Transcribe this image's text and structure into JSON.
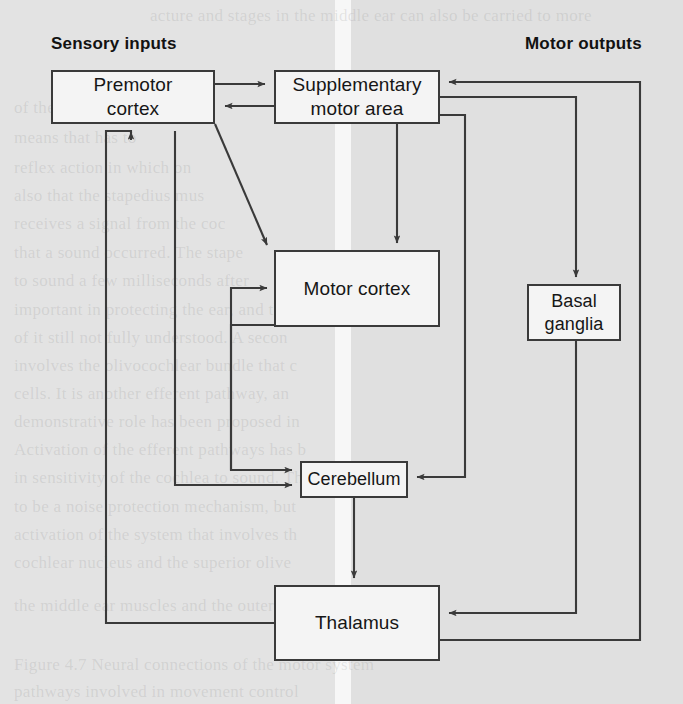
{
  "figure": {
    "labels": {
      "sensory_inputs": "Sensory inputs",
      "motor_outputs": "Motor outputs"
    },
    "nodes": [
      {
        "id": "premotor_cortex",
        "label": "Premotor\ncortex",
        "line1": "Premotor",
        "line2": "cortex",
        "x": 51,
        "y": 70,
        "w": 164,
        "h": 54
      },
      {
        "id": "supplementary_motor_area",
        "label": "Supplementary\nmotor area",
        "line1": "Supplementary",
        "line2": "motor area",
        "x": 274,
        "y": 70,
        "w": 166,
        "h": 54
      },
      {
        "id": "motor_cortex",
        "label": "Motor cortex",
        "line1": "Motor cortex",
        "line2": "",
        "x": 274,
        "y": 250,
        "w": 166,
        "h": 77
      },
      {
        "id": "basal_ganglia",
        "label": "Basal\nganglia",
        "line1": "Basal",
        "line2": "ganglia",
        "x": 527,
        "y": 284,
        "w": 94,
        "h": 57
      },
      {
        "id": "cerebellum",
        "label": "Cerebellum",
        "line1": "Cerebellum",
        "line2": "",
        "x": 300,
        "y": 461,
        "w": 108,
        "h": 37
      },
      {
        "id": "thalamus",
        "label": "Thalamus",
        "line1": "Thalamus",
        "line2": "",
        "x": 274,
        "y": 585,
        "w": 166,
        "h": 76
      }
    ],
    "edges": [
      {
        "from": "premotor_cortex",
        "to": "supplementary_motor_area",
        "arrow": true,
        "note": "premotor to SMA, top rail"
      },
      {
        "from": "supplementary_motor_area",
        "to": "premotor_cortex",
        "arrow": true,
        "note": "SMA to premotor, lower rail"
      },
      {
        "from": "premotor_cortex",
        "to": "motor_cortex",
        "arrow": true,
        "note": "diagonal from premotor bottom-right corner"
      },
      {
        "from": "supplementary_motor_area",
        "to": "motor_cortex",
        "arrow": true,
        "note": "vertical drop"
      },
      {
        "from": "supplementary_motor_area",
        "to": "basal_ganglia",
        "arrow": true,
        "note": "right rail down to basal ganglia"
      },
      {
        "from": "supplementary_motor_area",
        "to": "cerebellum",
        "arrow": true,
        "note": "right rail down then left into cerebellum"
      },
      {
        "from": "motor_cortex",
        "to": "cerebellum",
        "arrow": true,
        "note": "left rail down into cerebellum"
      },
      {
        "from": "cerebellum",
        "to": "motor_cortex",
        "arrow": true,
        "note": "left rail up into motor cortex"
      },
      {
        "from": "cerebellum",
        "to": "thalamus",
        "arrow": true,
        "note": "vertical drop"
      },
      {
        "from": "basal_ganglia",
        "to": "thalamus",
        "arrow": true,
        "note": "down then left into thalamus right edge"
      },
      {
        "from": "thalamus",
        "to": "premotor_cortex",
        "arrow": true,
        "note": "left rail up into premotor bottom"
      },
      {
        "from": "thalamus",
        "to": "supplementary_motor_area",
        "arrow": true,
        "note": "far right rail up into SMA right edge"
      },
      {
        "from": "thalamus",
        "to": "cerebellum",
        "arrow": true,
        "note": "left rail up into cerebellum left edge"
      }
    ],
    "colors": {
      "stroke": "#3a3a3a",
      "box_fill": "#f4f4f4",
      "text": "#161616",
      "page_left": "#e3e3e3",
      "page_right": "#e0e0e0",
      "gutter": "#f7f7f7"
    }
  },
  "ghost_text": {
    "lines": [
      {
        "text": "acture and stages in the middle ear can also be carried to more",
        "x": 150,
        "y": 6
      },
      {
        "text": "of the openin",
        "x": 14,
        "y": 98
      },
      {
        "text": "means that has to",
        "x": 14,
        "y": 128
      },
      {
        "text": "reflex action in which on",
        "x": 14,
        "y": 158
      },
      {
        "text": "also that the stapedius mus",
        "x": 14,
        "y": 186
      },
      {
        "text": "receives a signal from the coc",
        "x": 14,
        "y": 214
      },
      {
        "text": "that a sound occurred. The stape",
        "x": 14,
        "y": 243
      },
      {
        "text": "to sound a few milliseconds after",
        "x": 14,
        "y": 271
      },
      {
        "text": "important in protecting the ear, and th",
        "x": 14,
        "y": 300
      },
      {
        "text": "of it still not fully understood. A secon",
        "x": 14,
        "y": 328
      },
      {
        "text": "involves the olivocochlear bundle that c",
        "x": 14,
        "y": 356
      },
      {
        "text": "cells. It is another efferent pathway, an",
        "x": 14,
        "y": 384
      },
      {
        "text": "demonstrative role has been proposed in",
        "x": 14,
        "y": 412
      },
      {
        "text": "Activation of the efferent pathways has b",
        "x": 14,
        "y": 440
      },
      {
        "text": "in sensitivity of the cochlea to sound. The",
        "x": 14,
        "y": 468
      },
      {
        "text": "to be a noise protection mechanism, but",
        "x": 14,
        "y": 497
      },
      {
        "text": "activation of the system that involves th",
        "x": 14,
        "y": 525
      },
      {
        "text": "cochlear nucleus and the superior olive",
        "x": 14,
        "y": 553
      },
      {
        "text": "the middle ear muscles and the outer hair",
        "x": 14,
        "y": 596
      },
      {
        "text": "Figure 4.7  Neural connections of the motor system",
        "x": 14,
        "y": 655
      },
      {
        "text": "pathways involved in movement control",
        "x": 14,
        "y": 682
      }
    ]
  }
}
